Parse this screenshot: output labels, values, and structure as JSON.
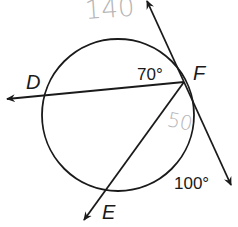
{
  "diagram": {
    "type": "circle-secant-tangent-geometry",
    "circle": {
      "cx": 118,
      "cy": 115,
      "r": 76
    },
    "points": {
      "D": {
        "label": "D"
      },
      "E": {
        "label": "E"
      },
      "F": {
        "label": "F"
      }
    },
    "angle_labels": [
      {
        "id": "angle-DF",
        "text": "70°"
      },
      {
        "id": "arc-bottom-right",
        "text": "100°"
      }
    ],
    "handwritten_annotations": [
      {
        "id": "hand-top",
        "text": "140"
      },
      {
        "id": "hand-inner",
        "text": "50"
      }
    ],
    "colors": {
      "stroke": "#1a1a1a",
      "handwriting": "#b5b5b5",
      "background": "#ffffff"
    }
  }
}
